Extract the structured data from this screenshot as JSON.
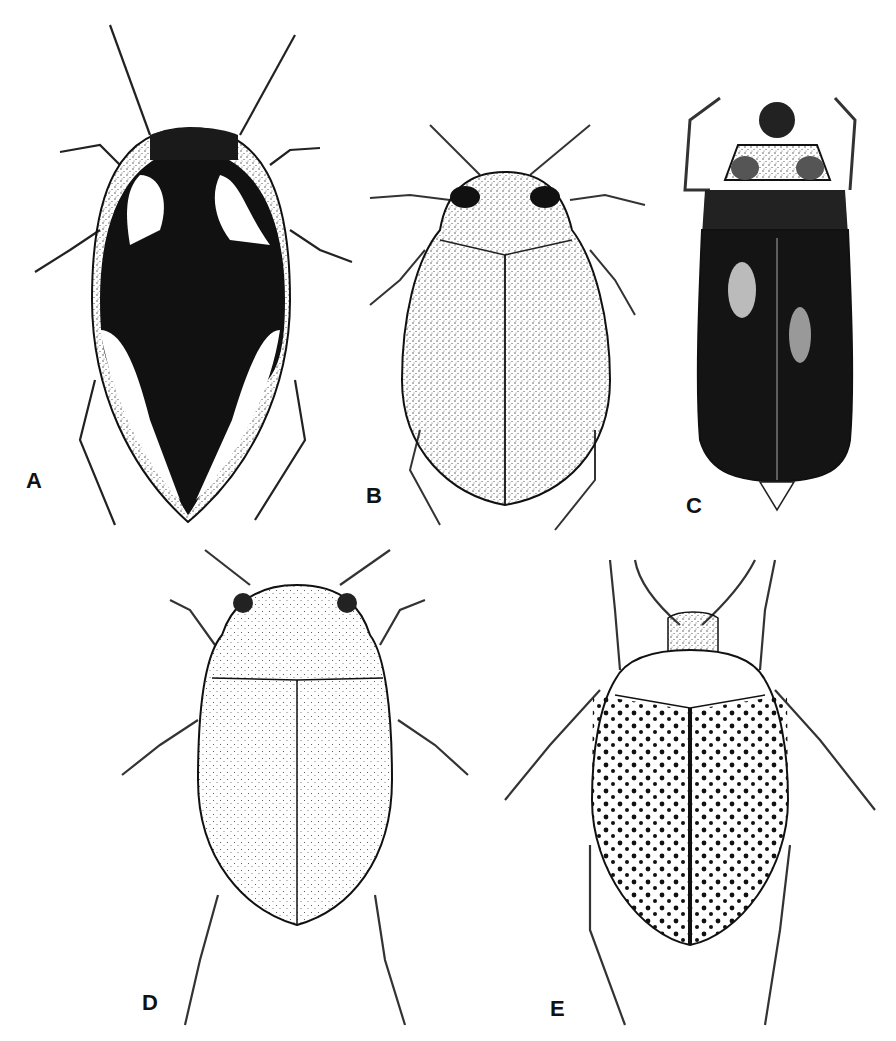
{
  "figure": {
    "type": "scientific illustration plate",
    "panels": [
      {
        "id": "A",
        "label": "A",
        "description": "dark beetle with pale elytral markings, pointed apex, long antennae"
      },
      {
        "id": "B",
        "label": "B",
        "description": "oval stippled beetle with striate elytra and dark eyes"
      },
      {
        "id": "C",
        "label": "C",
        "description": "elongate dark beetle with raised forelegs and pale elytral spots"
      },
      {
        "id": "D",
        "label": "D",
        "description": "oval finely stippled beetle with pointed apex"
      },
      {
        "id": "E",
        "label": "E",
        "description": "rounded beetle with rows of punctures and dark spots"
      }
    ]
  },
  "colors": {
    "ink": "#111111",
    "paper": "#ffffff",
    "stipple": "#555555"
  }
}
